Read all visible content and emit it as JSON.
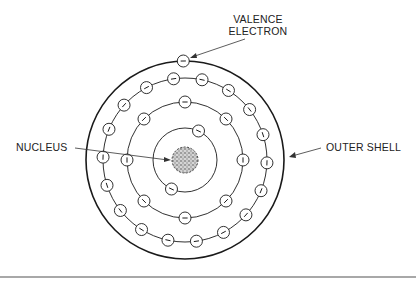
{
  "diagram": {
    "labels": {
      "valence_line1": "VALENCE",
      "valence_line2": "ELECTRON",
      "nucleus": "NUCLEUS",
      "outer_shell": "OUTER SHELL"
    },
    "center": [
      185,
      160
    ],
    "nucleus_radius": 13,
    "electron_radius": 6,
    "shells": [
      {
        "name": "shell-1",
        "radius": 32,
        "electrons": 2,
        "angles": [
          25,
          205
        ]
      },
      {
        "name": "shell-2",
        "radius": 58,
        "electrons": 8,
        "angles": [
          0,
          45,
          90,
          135,
          180,
          225,
          270,
          315
        ]
      },
      {
        "name": "shell-3",
        "radius": 82,
        "electrons": 18,
        "angles": [
          -8,
          12,
          32,
          52,
          72,
          92,
          112,
          132,
          152,
          172,
          192,
          212,
          232,
          252,
          272,
          292,
          312,
          332
        ]
      },
      {
        "name": "outer-shell",
        "radius": 99,
        "electrons": 1,
        "angles": [
          -1
        ],
        "thick": true
      }
    ],
    "colors": {
      "stroke": "#1a1a1a",
      "nucleus_fill": "#bdbdbd",
      "divider": "#a8a8a8"
    }
  }
}
